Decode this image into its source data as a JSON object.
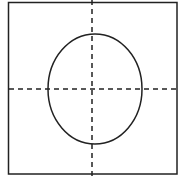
{
  "diagram": {
    "frame": {
      "x": 8.5,
      "y": 2.5,
      "width": 168.5,
      "height": 171.5,
      "stroke": "#222222"
    },
    "horizontal_axis": {
      "x1": 9,
      "x2": 177,
      "y": 89,
      "style": "dashed"
    },
    "vertical_axis": {
      "x": 92,
      "y1": 0,
      "y2": 176,
      "style": "dashed"
    },
    "ellipse": {
      "cx": 95,
      "cy": 89,
      "rx": 47,
      "ry": 55,
      "stroke": "#222222"
    }
  }
}
